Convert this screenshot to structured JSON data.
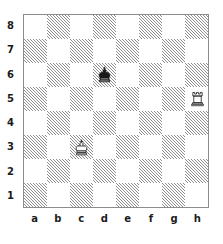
{
  "diagram": {
    "type": "chess-board-diagram",
    "orientation": "white-bottom",
    "board_size": 8,
    "colors": {
      "light_square": "#ffffff",
      "dark_square_hatch": "#8e8e8e",
      "border": "#8c8c8c",
      "label_text": "#1b1b1b",
      "black_piece": "#1a1a1a",
      "white_piece_outline": "#1a1a1a",
      "white_piece_fill": "#ffffff"
    },
    "file_labels": [
      "a",
      "b",
      "c",
      "d",
      "e",
      "f",
      "g",
      "h"
    ],
    "rank_labels": [
      "8",
      "7",
      "6",
      "5",
      "4",
      "3",
      "2",
      "1"
    ],
    "dark_square_parity_note": "a1 is a dark (hatched) square",
    "pieces": [
      {
        "id": "black-king-d6",
        "piece": "king",
        "color": "black",
        "icon": "black-king-icon",
        "square": "d6",
        "file": "d",
        "rank": "6",
        "file_index": 3,
        "rank_index": 2,
        "square_shade": "light"
      },
      {
        "id": "white-rook-h5",
        "piece": "rook",
        "color": "white",
        "icon": "white-rook-icon",
        "square": "h5",
        "file": "h",
        "rank": "5",
        "file_index": 7,
        "rank_index": 3,
        "square_shade": "light"
      },
      {
        "id": "white-king-c3",
        "piece": "king",
        "color": "white",
        "icon": "white-king-icon",
        "square": "c3",
        "file": "c",
        "rank": "3",
        "file_index": 2,
        "rank_index": 5,
        "square_shade": "dark"
      }
    ],
    "position_fen": "8/8/3k4/7R/8/2K5/8/8"
  }
}
